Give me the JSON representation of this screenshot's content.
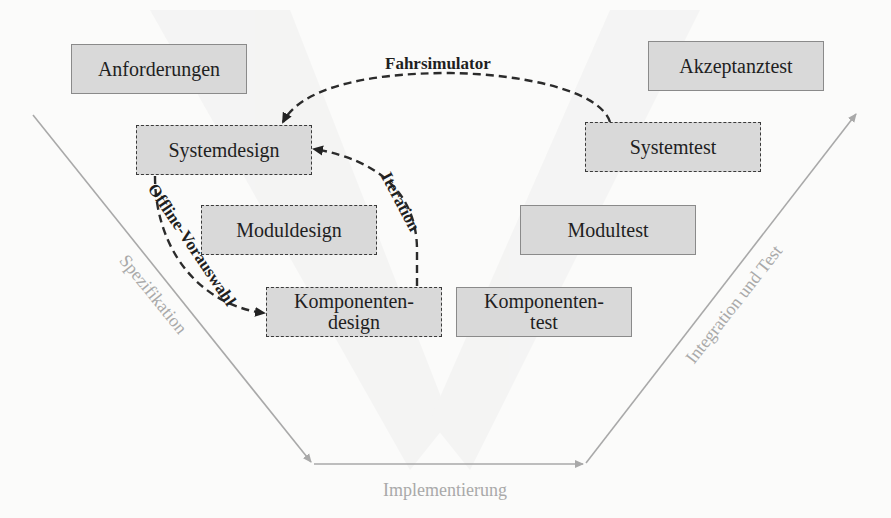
{
  "diagram": {
    "type": "V-Modell",
    "colors": {
      "box_fill": "#d9d9d9",
      "axis_line": "#a9a9a9",
      "axis_text": "#a9a9a9",
      "dashed_arrow": "#2b2b2b",
      "text": "#1f1f1f"
    },
    "left_branch": {
      "axis_label": "Spezifikation",
      "boxes": [
        {
          "id": "anforderungen",
          "label": "Anforderungen",
          "style": "solid"
        },
        {
          "id": "systemdesign",
          "label": "Systemdesign",
          "style": "dashed"
        },
        {
          "id": "moduldesign",
          "label": "Moduldesign",
          "style": "dashed"
        },
        {
          "id": "komponentendesign",
          "label": "Komponenten-\ndesign",
          "style": "dashed"
        }
      ]
    },
    "bottom": {
      "axis_label": "Implementierung"
    },
    "right_branch": {
      "axis_label": "Integration und Test",
      "boxes": [
        {
          "id": "akzeptanztest",
          "label": "Akzeptanztest",
          "style": "solid"
        },
        {
          "id": "systemtest",
          "label": "Systemtest",
          "style": "dashed"
        },
        {
          "id": "modultest",
          "label": "Modultest",
          "style": "solid"
        },
        {
          "id": "komponententest",
          "label": "Komponenten-\ntest",
          "style": "solid"
        }
      ]
    },
    "arrows": [
      {
        "label": "Fahrsimulator",
        "from": "Systemtest",
        "to": "Systemdesign"
      },
      {
        "label": "Iteration",
        "from": "Komponentendesign",
        "to": "Systemdesign"
      },
      {
        "label": "Offline-Vorauswahl",
        "from": "Systemdesign",
        "to": "Komponentendesign"
      }
    ]
  }
}
